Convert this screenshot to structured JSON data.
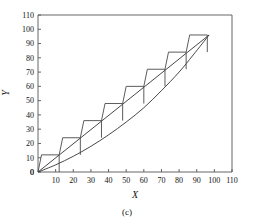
{
  "chart_data": {
    "type": "line",
    "title": "",
    "subtitle": "",
    "caption": "(c)",
    "xlabel": "X",
    "ylabel": "Y",
    "xlim": [
      0,
      110
    ],
    "ylim": [
      0,
      110
    ],
    "xticks": [
      0,
      10,
      20,
      30,
      40,
      50,
      60,
      70,
      80,
      90,
      100,
      110
    ],
    "yticks": [
      0,
      10,
      20,
      30,
      40,
      50,
      60,
      70,
      80,
      90,
      100,
      110
    ],
    "xtick_labels": [
      "0",
      "10",
      "20",
      "30",
      "40",
      "50",
      "60",
      "70",
      "80",
      "90",
      "100",
      "110"
    ],
    "ytick_labels": [
      "0",
      "10",
      "20",
      "30",
      "40",
      "50",
      "60",
      "70",
      "80",
      "90",
      "100",
      "110"
    ],
    "grid": false,
    "legend": null,
    "series": [
      {
        "name": "staircase",
        "type": "step-parallelogram",
        "note": "Sheared step function: each tread is horizontal, each riser is slanted back along the chord direction",
        "points": [
          [
            0,
            0
          ],
          [
            2,
            12
          ],
          [
            12,
            12
          ],
          [
            14,
            24
          ],
          [
            24,
            24
          ],
          [
            26,
            36
          ],
          [
            36,
            36
          ],
          [
            38,
            48
          ],
          [
            48,
            48
          ],
          [
            50,
            60
          ],
          [
            60,
            60
          ],
          [
            62,
            72
          ],
          [
            72,
            72
          ],
          [
            74,
            84
          ],
          [
            84,
            84
          ],
          [
            86,
            96
          ],
          [
            96,
            96
          ]
        ]
      },
      {
        "name": "chord-line",
        "type": "line",
        "note": "Straight secant line from origin to upper endpoint",
        "points": [
          [
            0,
            0
          ],
          [
            97,
            96
          ]
        ]
      },
      {
        "name": "convex-curve",
        "type": "curve",
        "note": "Convex increasing curve from origin to upper endpoint, lying below the chord",
        "points": [
          [
            0,
            0
          ],
          [
            10,
            5
          ],
          [
            20,
            11
          ],
          [
            30,
            18
          ],
          [
            40,
            26
          ],
          [
            50,
            35
          ],
          [
            60,
            45
          ],
          [
            70,
            57
          ],
          [
            80,
            70
          ],
          [
            88,
            82
          ],
          [
            97,
            96
          ]
        ]
      }
    ]
  },
  "axes": {
    "x_title": "X",
    "y_title": "Y"
  },
  "caption": {
    "label": "(c)"
  }
}
